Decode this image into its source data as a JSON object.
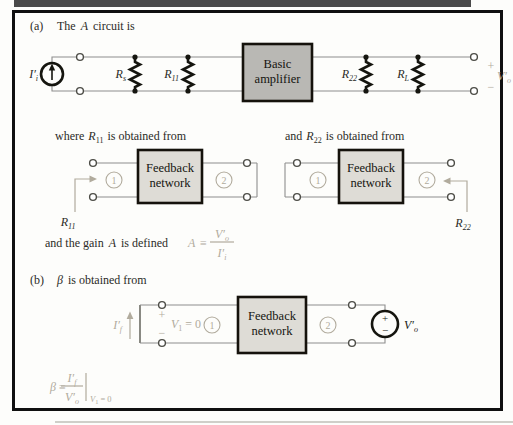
{
  "colors": {
    "accent": "#b1ab9d",
    "wire": "#8e8e8e",
    "amp_fill": "#b9b8b4",
    "fb_fill": "#dedcd6"
  },
  "symbols": {
    "plus": "+",
    "minus": "−",
    "equiv": "≡"
  },
  "ports": {
    "p1": "1",
    "p2": "2"
  },
  "feedback_box": {
    "line1": "Feedback",
    "line2": "network"
  },
  "part_a": {
    "tag": "(a)",
    "title_pre": "The",
    "title_var": "A",
    "title_post": "circuit is",
    "amplifier": {
      "line1": "Basic",
      "line2": "amplifier"
    },
    "labels": {
      "ii": {
        "base": "I′",
        "sub": "i"
      },
      "rs": {
        "base": "R",
        "sub": "s"
      },
      "r11": {
        "base": "R",
        "sub": "11"
      },
      "r22": {
        "base": "R",
        "sub": "22"
      },
      "rl": {
        "base": "R",
        "sub": "L"
      },
      "vo": {
        "base": "V′",
        "sub": "o"
      }
    }
  },
  "r11_section": {
    "title_pre": "where",
    "title_r_base": "R",
    "title_r_sub": "11",
    "title_post": "is obtained from",
    "pointer_base": "R",
    "pointer_sub": "11"
  },
  "r22_section": {
    "title_pre": "and",
    "title_r_base": "R",
    "title_r_sub": "22",
    "title_post": "is obtained from",
    "pointer_base": "R",
    "pointer_sub": "22"
  },
  "gain_line": {
    "pre": "and the gain",
    "var": "A",
    "post": "is defined",
    "lhs": "A",
    "num_base": "V′",
    "num_sub": "o",
    "den_base": "I′",
    "den_sub": "i"
  },
  "part_b": {
    "tag": "(b)",
    "title_var": "β",
    "title_post": "is obtained from",
    "if_base": "I′",
    "if_sub": "f",
    "v1_base": "V",
    "v1_sub": "1",
    "v1_eq": "= 0",
    "vo_base": "V′",
    "vo_sub": "o",
    "formula": {
      "lhs": "β",
      "num_base": "I′",
      "num_sub": "f",
      "den_base": "V′",
      "den_sub": "o",
      "cond_base": "V",
      "cond_sub": "1",
      "cond_eq": "= 0"
    }
  }
}
